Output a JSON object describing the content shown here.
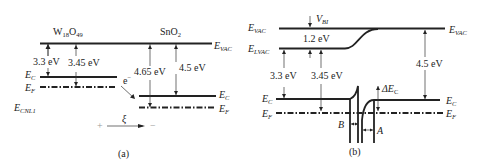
{
  "panel_a": {
    "caption": "(a)",
    "material_left": {
      "base": "W",
      "sub1": "18",
      "mid": "O",
      "sub2": "49"
    },
    "material_right": {
      "base": "SnO",
      "sub": "2"
    },
    "labels": {
      "evac": {
        "main": "E",
        "sub": "VAC"
      },
      "ec_left": {
        "main": "E",
        "sub": "C"
      },
      "ef_left": {
        "main": "E",
        "sub": "F"
      },
      "ecnl": {
        "main": "E",
        "sub": "CNL1"
      },
      "ec_right": {
        "main": "E",
        "sub": "C"
      },
      "ef_right": {
        "main": "E",
        "sub": "F"
      },
      "electron": "e",
      "electron_sup": "−",
      "field": "ξ",
      "plus": "+",
      "minus": "−"
    },
    "values": {
      "electron_affinity_w18o49": "3.3 eV",
      "work_function_w18o49": "3.45 eV",
      "work_function_sno2": "4.65 eV",
      "electron_affinity_sno2": "4.5 eV"
    }
  },
  "panel_b": {
    "caption": "(b)",
    "labels": {
      "evac_left": {
        "main": "E",
        "sub": "VAC"
      },
      "evac_right": {
        "main": "E",
        "sub": "VAC"
      },
      "elvac": {
        "main": "E",
        "sub": "LVAC"
      },
      "vbi": {
        "main": "V",
        "sub": "BI"
      },
      "ec_left": {
        "main": "E",
        "sub": "C"
      },
      "ef_left": {
        "main": "E",
        "sub": "F"
      },
      "ec_right": {
        "main": "E",
        "sub": "C"
      },
      "ef_right": {
        "main": "E",
        "sub": "F"
      },
      "delta_ec": {
        "main": "ΔE",
        "sub": "C"
      },
      "region_b": "B",
      "region_a": "A"
    },
    "values": {
      "vbi_value": "1.2 eV",
      "electron_affinity_w18o49": "3.3 eV",
      "work_function_w18o49": "3.45 eV",
      "electron_affinity_sno2": "4.5 eV"
    }
  }
}
